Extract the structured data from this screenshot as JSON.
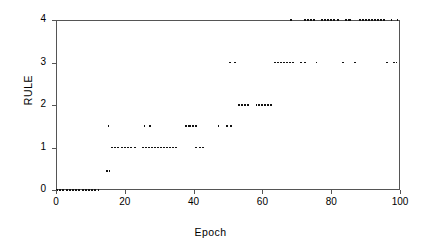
{
  "chart_data": {
    "type": "scatter",
    "title": "",
    "xlabel": "Epoch",
    "ylabel": "RULE",
    "xlim": [
      0,
      100
    ],
    "ylim": [
      0,
      4
    ],
    "xticks": [
      0,
      20,
      40,
      60,
      80,
      100
    ],
    "yticks": [
      0,
      1,
      2,
      3,
      4
    ],
    "xtick_labels": [
      "0",
      "20",
      "40",
      "60",
      "80",
      "100"
    ],
    "ytick_labels": [
      "0",
      "1",
      "2",
      "3",
      "4"
    ],
    "grid": false,
    "legend": null,
    "marker": "small-dash",
    "color": "#111111",
    "segments": [
      {
        "y": 0.0,
        "x_start": 0.0,
        "x_end": 13.0
      },
      {
        "y": 0.45,
        "x_start": 14.6,
        "x_end": 16.0
      },
      {
        "y": 1.5,
        "x_start": 15.0,
        "x_end": 15.6
      },
      {
        "y": 1.0,
        "x_start": 16.0,
        "x_end": 23.5
      },
      {
        "y": 1.5,
        "x_start": 25.5,
        "x_end": 26.3
      },
      {
        "y": 1.5,
        "x_start": 27.0,
        "x_end": 27.8
      },
      {
        "y": 1.0,
        "x_start": 25.0,
        "x_end": 35.5
      },
      {
        "y": 1.5,
        "x_start": 37.5,
        "x_end": 41.5
      },
      {
        "y": 1.0,
        "x_start": 40.5,
        "x_end": 43.5
      },
      {
        "y": 1.5,
        "x_start": 47.0,
        "x_end": 47.8
      },
      {
        "y": 1.5,
        "x_start": 49.5,
        "x_end": 51.5
      },
      {
        "y": 3.0,
        "x_start": 50.3,
        "x_end": 51.2
      },
      {
        "y": 3.0,
        "x_start": 51.8,
        "x_end": 52.8
      },
      {
        "y": 2.0,
        "x_start": 53.0,
        "x_end": 56.5
      },
      {
        "y": 2.0,
        "x_start": 58.0,
        "x_end": 63.0
      },
      {
        "y": 4.0,
        "x_start": 68.0,
        "x_end": 68.6
      },
      {
        "y": 3.0,
        "x_start": 63.5,
        "x_end": 69.5
      },
      {
        "y": 3.0,
        "x_start": 71.0,
        "x_end": 73.0
      },
      {
        "y": 4.0,
        "x_start": 72.0,
        "x_end": 75.5
      },
      {
        "y": 3.0,
        "x_start": 75.5,
        "x_end": 76.3
      },
      {
        "y": 4.0,
        "x_start": 77.0,
        "x_end": 82.5
      },
      {
        "y": 4.0,
        "x_start": 84.0,
        "x_end": 86.0
      },
      {
        "y": 3.0,
        "x_start": 83.0,
        "x_end": 84.0
      },
      {
        "y": 3.0,
        "x_start": 86.5,
        "x_end": 87.5
      },
      {
        "y": 4.0,
        "x_start": 88.0,
        "x_end": 96.0
      },
      {
        "y": 4.0,
        "x_start": 97.3,
        "x_end": 97.9
      },
      {
        "y": 4.0,
        "x_start": 99.0,
        "x_end": 99.8
      },
      {
        "y": 3.0,
        "x_start": 96.0,
        "x_end": 96.8
      },
      {
        "y": 3.0,
        "x_start": 98.0,
        "x_end": 99.5
      }
    ]
  },
  "axes": {
    "y_title": "RULE",
    "x_title": "Epoch"
  }
}
